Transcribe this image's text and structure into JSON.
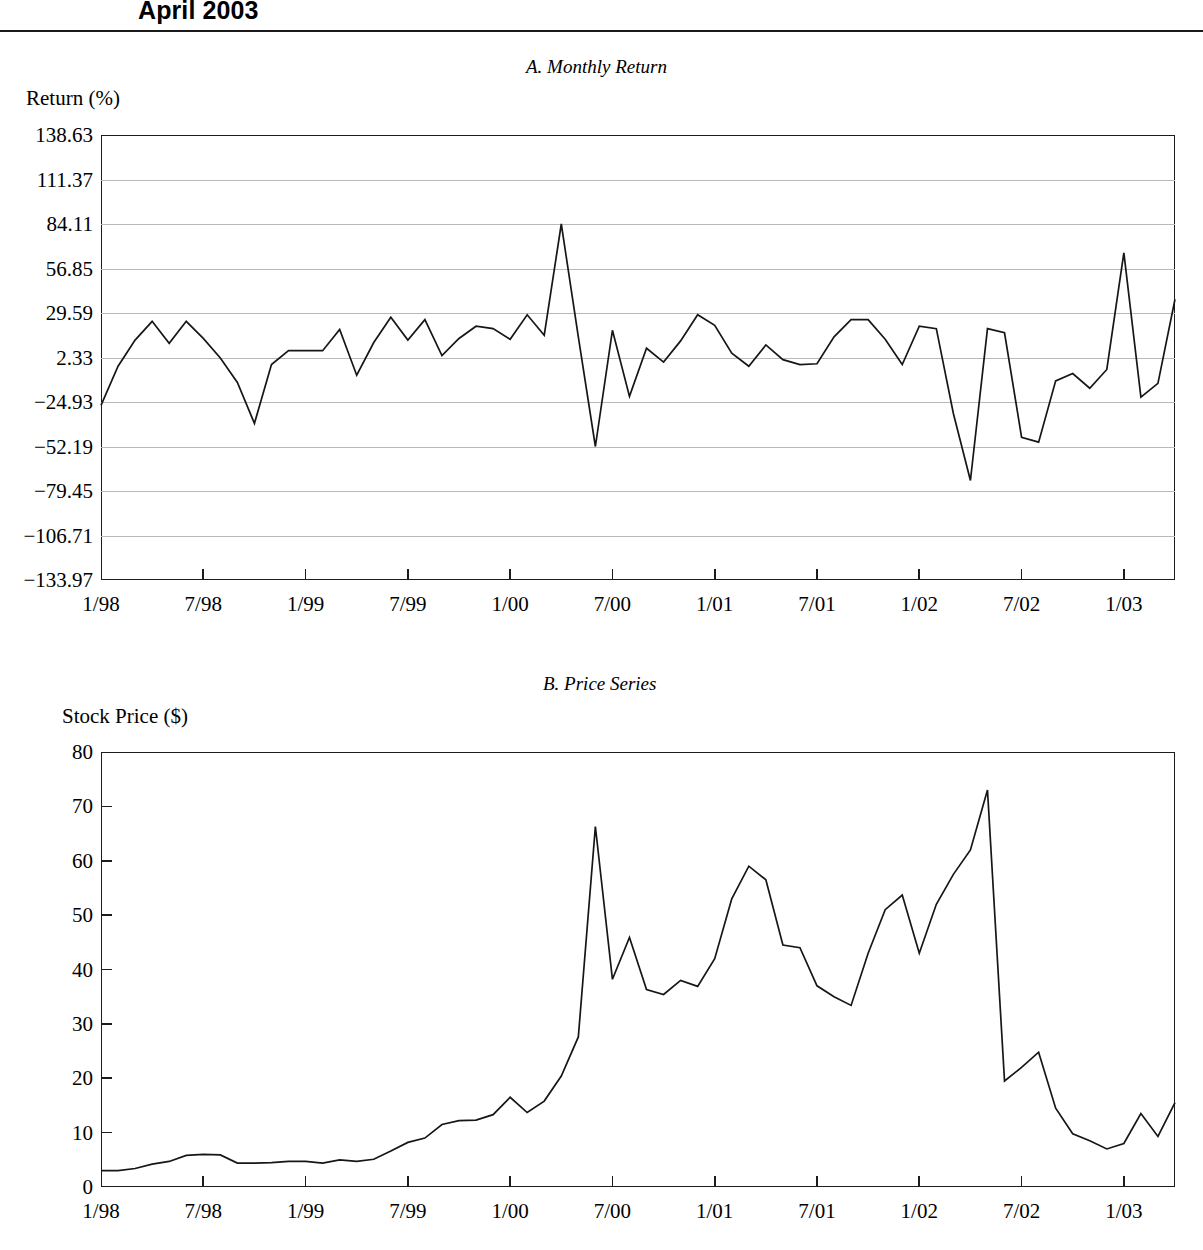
{
  "header": {
    "title": "April 2003"
  },
  "panel_a": {
    "title": "A. Monthly Return",
    "ylabel": "Return (%)"
  },
  "panel_b": {
    "title": "B. Price Series",
    "ylabel": "Stock Price ($)"
  },
  "chart_data": [
    {
      "id": "monthly-return",
      "type": "line",
      "title": "A. Monthly Return",
      "xlabel": "",
      "ylabel": "Return (%)",
      "ylim": [
        -133.97,
        138.63
      ],
      "yticks": [
        138.63,
        111.37,
        84.11,
        56.85,
        29.59,
        2.33,
        -24.93,
        -52.19,
        -79.45,
        -106.71,
        -133.97
      ],
      "ytick_labels": [
        "138.63",
        "111.37",
        "84.11",
        "56.85",
        "29.59",
        "2.33",
        "-24.93",
        "-52.19",
        "-79.45",
        "-106.71",
        "-133.97"
      ],
      "xticks": [
        "1/98",
        "7/98",
        "1/99",
        "7/99",
        "1/00",
        "7/00",
        "1/01",
        "7/01",
        "1/02",
        "7/02",
        "1/03"
      ],
      "xlim": [
        "1/98",
        "4/03"
      ],
      "grid": "horizontal",
      "legend": "none",
      "x": [
        "1/98",
        "2/98",
        "3/98",
        "4/98",
        "5/98",
        "6/98",
        "7/98",
        "8/98",
        "9/98",
        "10/98",
        "11/98",
        "12/98",
        "1/99",
        "2/99",
        "3/99",
        "4/99",
        "5/99",
        "6/99",
        "7/99",
        "8/99",
        "9/99",
        "10/99",
        "11/99",
        "12/99",
        "1/00",
        "2/00",
        "3/00",
        "4/00",
        "5/00",
        "6/00",
        "7/00",
        "8/00",
        "9/00",
        "10/00",
        "11/00",
        "12/00",
        "1/01",
        "2/01",
        "3/01",
        "4/01",
        "5/01",
        "6/01",
        "7/01",
        "8/01",
        "9/01",
        "10/01",
        "11/01",
        "12/01",
        "1/02",
        "2/02",
        "3/02",
        "4/02",
        "5/02",
        "6/02",
        "7/02",
        "8/02",
        "9/02",
        "10/02",
        "11/02",
        "12/02",
        "1/03",
        "2/03",
        "3/03",
        "4/03"
      ],
      "values": [
        -27.0,
        -3.0,
        13.0,
        24.5,
        11.0,
        24.5,
        14.0,
        2.0,
        -13.0,
        -38.0,
        -2.0,
        6.5,
        6.5,
        6.5,
        19.5,
        -8.5,
        11.5,
        27.0,
        13.0,
        25.5,
        3.5,
        14.0,
        21.5,
        20.0,
        13.5,
        28.5,
        16.0,
        84.11,
        15.0,
        -52.19,
        19.0,
        -21.5,
        8.0,
        -0.5,
        12.5,
        28.5,
        22.0,
        5.0,
        -3.0,
        10.0,
        1.0,
        -2.0,
        -1.5,
        15.0,
        25.5,
        25.5,
        13.5,
        -2.0,
        21.5,
        20.0,
        -32.0,
        -73.0,
        20.0,
        17.5,
        -46.5,
        -49.5,
        -12.0,
        -7.5,
        -16.5,
        -5.0,
        66.5,
        -22.0,
        -13.5,
        38.0
      ],
      "series_last_value": 16.5
    },
    {
      "id": "price-series",
      "type": "line",
      "title": "B. Price Series",
      "xlabel": "",
      "ylabel": "Stock Price ($)",
      "ylim": [
        0,
        80
      ],
      "yticks": [
        80,
        70,
        60,
        50,
        40,
        30,
        20,
        10,
        0
      ],
      "ytick_labels": [
        "80",
        "70",
        "60",
        "50",
        "40",
        "30",
        "20",
        "10",
        "0"
      ],
      "xticks": [
        "1/98",
        "7/98",
        "1/99",
        "7/99",
        "1/00",
        "7/00",
        "1/01",
        "7/01",
        "1/02",
        "7/02",
        "1/03"
      ],
      "xlim": [
        "1/98",
        "4/03"
      ],
      "grid": "none",
      "legend": "none",
      "x": [
        "1/98",
        "2/98",
        "3/98",
        "4/98",
        "5/98",
        "6/98",
        "7/98",
        "8/98",
        "9/98",
        "10/98",
        "11/98",
        "12/98",
        "1/99",
        "2/99",
        "3/99",
        "4/99",
        "5/99",
        "6/99",
        "7/99",
        "8/99",
        "9/99",
        "10/99",
        "11/99",
        "12/99",
        "1/00",
        "2/00",
        "3/00",
        "4/00",
        "5/00",
        "6/00",
        "7/00",
        "8/00",
        "9/00",
        "10/00",
        "11/00",
        "12/00",
        "1/01",
        "2/01",
        "3/01",
        "4/01",
        "5/01",
        "6/01",
        "7/01",
        "8/01",
        "9/01",
        "10/01",
        "11/01",
        "12/01",
        "1/02",
        "2/02",
        "3/02",
        "4/02",
        "5/02",
        "6/02",
        "7/02",
        "8/02",
        "9/02",
        "10/02",
        "11/02",
        "12/02",
        "1/03",
        "2/03",
        "3/03",
        "4/03"
      ],
      "values": [
        3.0,
        3.0,
        3.4,
        4.2,
        4.7,
        5.8,
        6.0,
        5.9,
        4.4,
        4.4,
        4.5,
        4.7,
        4.7,
        4.4,
        5.0,
        4.7,
        5.1,
        6.6,
        8.2,
        9.0,
        11.5,
        12.2,
        12.3,
        13.3,
        16.5,
        13.7,
        15.8,
        20.4,
        27.6,
        66.3,
        38.2,
        45.9,
        36.3,
        35.4,
        38.0,
        36.9,
        42.0,
        53.0,
        59.0,
        56.5,
        44.5,
        44.0,
        37.0,
        35.0,
        33.4,
        43.0,
        51.0,
        53.7,
        43.0,
        52.0,
        57.5,
        62.0,
        73.0,
        19.5,
        22.0,
        24.8,
        14.5,
        9.8,
        8.5,
        7.0,
        8.0,
        13.5,
        9.3,
        15.5
      ],
      "series_last_value": 18.5
    }
  ]
}
